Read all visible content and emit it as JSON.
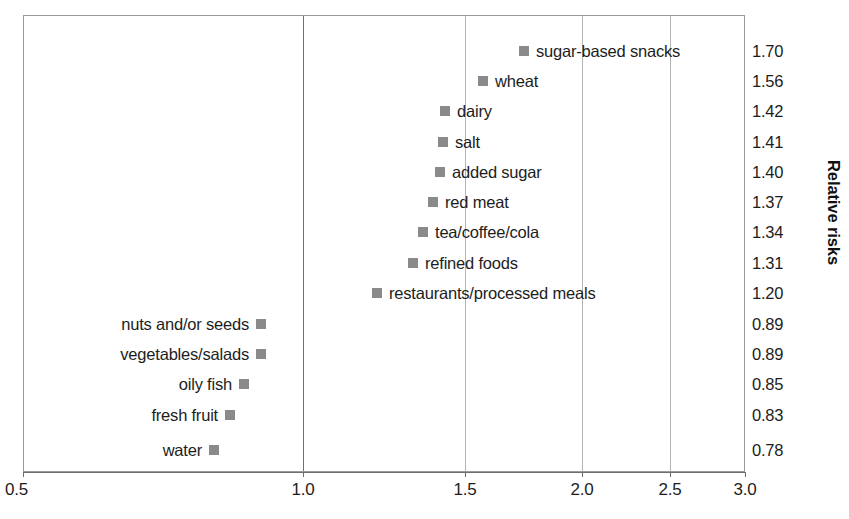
{
  "chart_data": {
    "type": "scatter",
    "title": "",
    "xlabel": "",
    "ylabel": "Relative risks",
    "xlim": [
      0.5,
      3.0
    ],
    "grid": true,
    "legend": null,
    "reference_line": 1.0,
    "x_ticks": [
      "0.5",
      "1.0",
      "1.5",
      "2.0",
      "2.5",
      "3.0"
    ],
    "x_tick_values": [
      0.5,
      1.0,
      1.5,
      2.0,
      2.5,
      3.0
    ],
    "categories": [
      "sugar-based snacks",
      "wheat",
      "dairy",
      "salt",
      "added sugar",
      "red meat",
      "tea/coffee/cola",
      "refined foods",
      "restaurants/processed meals",
      "nuts and/or seeds",
      "vegetables/salads",
      "oily fish",
      "fresh fruit",
      "water"
    ],
    "values": [
      1.7,
      1.56,
      1.42,
      1.41,
      1.4,
      1.37,
      1.34,
      1.31,
      1.2,
      0.89,
      0.89,
      0.85,
      0.83,
      0.78
    ],
    "value_labels": [
      "1.70",
      "1.56",
      "1.42",
      "1.41",
      "1.40",
      "1.37",
      "1.34",
      "1.31",
      "1.20",
      "0.89",
      "0.89",
      "0.85",
      "0.83",
      "0.78"
    ]
  },
  "axis": {
    "y_title": "Relative risks"
  },
  "points": [
    {
      "label": "sugar-based snacks",
      "value": "1.70",
      "marker_x": 519,
      "row_y": 38,
      "label_side": "right"
    },
    {
      "label": "wheat",
      "value": "1.56",
      "marker_x": 478,
      "row_y": 68,
      "label_side": "right"
    },
    {
      "label": "dairy",
      "value": "1.42",
      "marker_x": 440,
      "row_y": 98,
      "label_side": "right"
    },
    {
      "label": "salt",
      "value": "1.41",
      "marker_x": 438,
      "row_y": 129,
      "label_side": "right"
    },
    {
      "label": "added sugar",
      "value": "1.40",
      "marker_x": 435,
      "row_y": 159,
      "label_side": "right"
    },
    {
      "label": "red meat",
      "value": "1.37",
      "marker_x": 428,
      "row_y": 189,
      "label_side": "right"
    },
    {
      "label": "tea/coffee/cola",
      "value": "1.34",
      "marker_x": 418,
      "row_y": 219,
      "label_side": "right"
    },
    {
      "label": "refined foods",
      "value": "1.31",
      "marker_x": 408,
      "row_y": 250,
      "label_side": "right"
    },
    {
      "label": "restaurants/processed meals",
      "value": "1.20",
      "marker_x": 372,
      "row_y": 280,
      "label_side": "right"
    },
    {
      "label": "nuts and/or seeds",
      "value": "0.89",
      "marker_x": 256,
      "row_y": 311,
      "label_side": "left"
    },
    {
      "label": "vegetables/salads",
      "value": "0.89",
      "marker_x": 256,
      "row_y": 341,
      "label_side": "left"
    },
    {
      "label": "oily fish",
      "value": "0.85",
      "marker_x": 239,
      "row_y": 371,
      "label_side": "left"
    },
    {
      "label": "fresh fruit",
      "value": "0.83",
      "marker_x": 225,
      "row_y": 402,
      "label_side": "left"
    },
    {
      "label": "water",
      "value": "0.78",
      "marker_x": 209,
      "row_y": 437,
      "label_side": "left"
    }
  ],
  "gridlines": [
    {
      "name": "1.0",
      "x": 303,
      "major": true
    },
    {
      "name": "1.5",
      "x": 465,
      "major": false
    },
    {
      "name": "2.0",
      "x": 582,
      "major": false
    },
    {
      "name": "2.5",
      "x": 670,
      "major": false
    }
  ],
  "x_ticks": [
    {
      "label": "0.5",
      "x": 23
    },
    {
      "label": "1.0",
      "x": 303
    },
    {
      "label": "1.5",
      "x": 465
    },
    {
      "label": "2.0",
      "x": 582
    },
    {
      "label": "2.5",
      "x": 670
    },
    {
      "label": "3.0",
      "x": 745
    }
  ],
  "colors": {
    "marker": "#8a8a8a",
    "frame": "#9a9a9a",
    "gridline": "#b5b5b5",
    "gridline_major": "#6f6f6f",
    "text": "#1d1d1d"
  }
}
